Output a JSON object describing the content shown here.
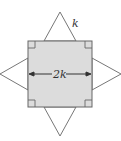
{
  "diagram": {
    "type": "geometry-star-square",
    "square": {
      "fill": "#dcdcdc",
      "stroke": "#666666",
      "side_label": "2k"
    },
    "triangle_side_label": "k",
    "right_angle_marks": 4,
    "triangles": [
      "top",
      "right",
      "bottom",
      "left"
    ]
  }
}
